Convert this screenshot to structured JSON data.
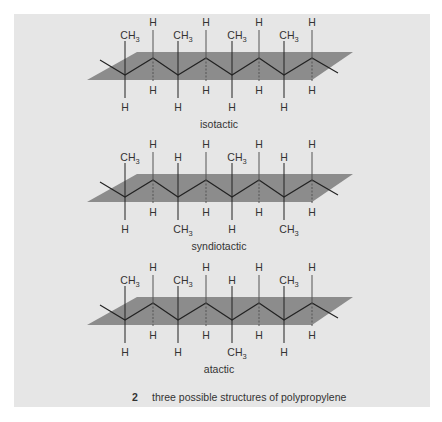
{
  "figure": {
    "number": "2",
    "caption": "three possible structures of polypropylene",
    "colors": {
      "panel": "#e6e6e6",
      "plane": "#8c8c8c",
      "bond": "#222222",
      "text": "#333333"
    },
    "structures": [
      {
        "name": "isotactic",
        "label": "isotactic",
        "above": [
          "CH3",
          "H",
          "CH3",
          "H",
          "CH3",
          "H",
          "CH3",
          "H"
        ],
        "below": [
          "H",
          "H",
          "H",
          "H",
          "H",
          "H",
          "H",
          "H"
        ]
      },
      {
        "name": "syndiotactic",
        "label": "syndiotactic",
        "above": [
          "CH3",
          "H",
          "H",
          "H",
          "CH3",
          "H",
          "H",
          "H"
        ],
        "below": [
          "H",
          "H",
          "CH3",
          "H",
          "H",
          "H",
          "CH3",
          "H"
        ]
      },
      {
        "name": "atactic",
        "label": "atactic",
        "above": [
          "CH3",
          "H",
          "CH3",
          "H",
          "H",
          "H",
          "CH3",
          "H"
        ],
        "below": [
          "H",
          "H",
          "H",
          "H",
          "CH3",
          "H",
          "H",
          "H"
        ]
      }
    ]
  }
}
